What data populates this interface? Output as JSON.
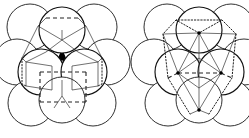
{
  "figure": {
    "background_color": "#ffffff",
    "line_color": "#1a1a1a",
    "fill_color": "#ffffff",
    "interstice_color": "#000000",
    "width": 249,
    "height": 138,
    "panels": [
      {
        "id": "left",
        "name": "cubic-close-packed",
        "label": "",
        "cell_style": "dashed",
        "cell_shape": "cube",
        "center_x": 62,
        "center_y": 67,
        "sphere_radius": 23,
        "spheres": [
          {
            "cx": 62,
            "cy": 30,
            "layer": "top",
            "emphasis": "front"
          },
          {
            "cx": 30,
            "cy": 27,
            "layer": "back",
            "emphasis": "outline"
          },
          {
            "cx": 94,
            "cy": 27,
            "layer": "back",
            "emphasis": "outline"
          },
          {
            "cx": 17,
            "cy": 62,
            "layer": "mid",
            "emphasis": "outline"
          },
          {
            "cx": 107,
            "cy": 62,
            "layer": "mid",
            "emphasis": "outline"
          },
          {
            "cx": 41,
            "cy": 72,
            "layer": "front",
            "emphasis": "front"
          },
          {
            "cx": 84,
            "cy": 72,
            "layer": "front",
            "emphasis": "front"
          },
          {
            "cx": 31,
            "cy": 103,
            "layer": "bottom",
            "emphasis": "outline"
          },
          {
            "cx": 93,
            "cy": 103,
            "layer": "bottom",
            "emphasis": "outline"
          },
          {
            "cx": 62,
            "cy": 100,
            "layer": "bottom",
            "emphasis": "outline"
          }
        ]
      },
      {
        "id": "right",
        "name": "hexagonal-close-packed",
        "label": "",
        "cell_style": "dotted",
        "cell_shape": "rhombohedron",
        "center_x": 199,
        "center_y": 67,
        "sphere_radius": 23,
        "spheres": [
          {
            "cx": 199,
            "cy": 30,
            "layer": "top",
            "emphasis": "front"
          },
          {
            "cx": 167,
            "cy": 27,
            "layer": "back",
            "emphasis": "outline"
          },
          {
            "cx": 231,
            "cy": 27,
            "layer": "back",
            "emphasis": "outline"
          },
          {
            "cx": 154,
            "cy": 62,
            "layer": "mid",
            "emphasis": "outline"
          },
          {
            "cx": 244,
            "cy": 62,
            "layer": "mid",
            "emphasis": "outline"
          },
          {
            "cx": 178,
            "cy": 72,
            "layer": "front",
            "emphasis": "front"
          },
          {
            "cx": 221,
            "cy": 72,
            "layer": "front",
            "emphasis": "front"
          },
          {
            "cx": 168,
            "cy": 103,
            "layer": "bottom",
            "emphasis": "outline"
          },
          {
            "cx": 230,
            "cy": 103,
            "layer": "bottom",
            "emphasis": "outline"
          },
          {
            "cx": 199,
            "cy": 100,
            "layer": "bottom",
            "emphasis": "outline"
          }
        ],
        "node_dots": [
          {
            "cx": 199,
            "cy": 33
          },
          {
            "cx": 178,
            "cy": 73
          },
          {
            "cx": 221,
            "cy": 73
          },
          {
            "cx": 199,
            "cy": 110
          }
        ]
      }
    ]
  }
}
